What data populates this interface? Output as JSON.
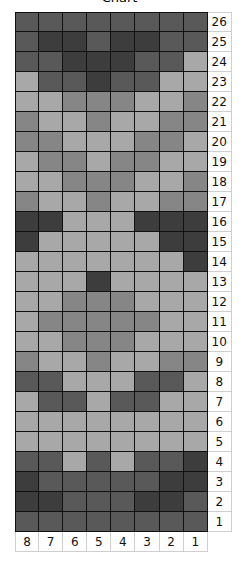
{
  "title": "Chart",
  "palette": {
    "1": "#a8a8a8",
    "2": "#868686",
    "3": "#595959",
    "4": "#3d3d3d"
  },
  "chart_data": {
    "type": "heatmap",
    "title": "Chart",
    "column_labels": [
      "8",
      "7",
      "6",
      "5",
      "4",
      "3",
      "2",
      "1"
    ],
    "row_labels": [
      "26",
      "25",
      "24",
      "23",
      "22",
      "21",
      "20",
      "19",
      "18",
      "17",
      "16",
      "15",
      "14",
      "13",
      "12",
      "11",
      "10",
      "9",
      "8",
      "7",
      "6",
      "5",
      "4",
      "3",
      "2",
      "1"
    ],
    "legend": {
      "1": "light",
      "2": "medium",
      "3": "dark",
      "4": "darkest"
    },
    "rows": [
      {
        "row": "26",
        "values": [
          3,
          3,
          3,
          3,
          3,
          3,
          3,
          3
        ]
      },
      {
        "row": "25",
        "values": [
          3,
          4,
          4,
          3,
          4,
          4,
          3,
          3
        ]
      },
      {
        "row": "24",
        "values": [
          3,
          3,
          4,
          4,
          4,
          3,
          3,
          1
        ]
      },
      {
        "row": "23",
        "values": [
          1,
          3,
          3,
          4,
          3,
          3,
          1,
          1
        ]
      },
      {
        "row": "22",
        "values": [
          1,
          1,
          2,
          2,
          2,
          1,
          1,
          2
        ]
      },
      {
        "row": "21",
        "values": [
          2,
          1,
          1,
          2,
          1,
          1,
          2,
          2
        ]
      },
      {
        "row": "20",
        "values": [
          2,
          2,
          1,
          1,
          1,
          2,
          2,
          1
        ]
      },
      {
        "row": "19",
        "values": [
          1,
          2,
          2,
          1,
          2,
          2,
          1,
          1
        ]
      },
      {
        "row": "18",
        "values": [
          1,
          1,
          2,
          2,
          2,
          1,
          1,
          2
        ]
      },
      {
        "row": "17",
        "values": [
          2,
          1,
          1,
          2,
          1,
          1,
          2,
          2
        ]
      },
      {
        "row": "16",
        "values": [
          4,
          4,
          1,
          1,
          1,
          4,
          4,
          4
        ]
      },
      {
        "row": "15",
        "values": [
          4,
          1,
          1,
          1,
          1,
          1,
          4,
          4
        ]
      },
      {
        "row": "14",
        "values": [
          1,
          1,
          1,
          1,
          1,
          1,
          1,
          4
        ]
      },
      {
        "row": "13",
        "values": [
          1,
          1,
          1,
          4,
          1,
          1,
          1,
          1
        ]
      },
      {
        "row": "12",
        "values": [
          1,
          1,
          2,
          2,
          2,
          1,
          1,
          1
        ]
      },
      {
        "row": "11",
        "values": [
          1,
          2,
          2,
          2,
          2,
          2,
          1,
          1
        ]
      },
      {
        "row": "10",
        "values": [
          1,
          1,
          2,
          2,
          2,
          1,
          1,
          1
        ]
      },
      {
        "row": "9",
        "values": [
          2,
          1,
          1,
          2,
          1,
          1,
          2,
          2
        ]
      },
      {
        "row": "8",
        "values": [
          3,
          3,
          1,
          1,
          1,
          3,
          3,
          1
        ]
      },
      {
        "row": "7",
        "values": [
          1,
          3,
          3,
          1,
          3,
          3,
          1,
          1
        ]
      },
      {
        "row": "6",
        "values": [
          1,
          1,
          1,
          1,
          1,
          1,
          1,
          1
        ]
      },
      {
        "row": "5",
        "values": [
          1,
          1,
          1,
          1,
          1,
          1,
          1,
          1
        ]
      },
      {
        "row": "4",
        "values": [
          3,
          3,
          1,
          3,
          1,
          3,
          3,
          4
        ]
      },
      {
        "row": "3",
        "values": [
          4,
          3,
          3,
          3,
          3,
          3,
          4,
          4
        ]
      },
      {
        "row": "2",
        "values": [
          4,
          4,
          3,
          3,
          3,
          4,
          4,
          3
        ]
      },
      {
        "row": "1",
        "values": [
          3,
          3,
          3,
          3,
          3,
          3,
          3,
          3
        ]
      }
    ]
  }
}
